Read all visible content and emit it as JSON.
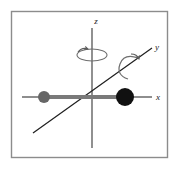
{
  "figure": {
    "frame": {
      "border_color": "#8c8c8c",
      "background_color": "#ffffff",
      "x": 11,
      "y": 11,
      "width": 157,
      "height": 147
    },
    "axes": [
      {
        "id": "z",
        "label": "z",
        "label_x": 96,
        "label_y": 24,
        "color": "#4d4d4d",
        "x1": 92,
        "y1": 28,
        "x2": 92,
        "y2": 148
      },
      {
        "id": "y",
        "label": "y",
        "label_x": 157,
        "label_y": 50,
        "color": "#1a1a1a",
        "x1": 33,
        "y1": 133,
        "x2": 152,
        "y2": 48
      },
      {
        "id": "x",
        "label": "x",
        "label_x": 158,
        "label_y": 100,
        "color": "#1a1a1a",
        "x1": 22,
        "y1": 97,
        "x2": 152,
        "y2": 97
      }
    ],
    "molecule": {
      "bond": {
        "color": "#7a7a7a",
        "x1": 44,
        "y1": 97,
        "x2": 125,
        "y2": 97,
        "thickness": 4
      },
      "atoms": [
        {
          "id": "atom-small",
          "color": "#666666",
          "cx": 44,
          "cy": 97,
          "r": 6
        },
        {
          "id": "atom-large",
          "color": "#111111",
          "cx": 125,
          "cy": 97,
          "r": 9
        }
      ]
    },
    "rotation_indicators": [
      {
        "id": "rotation-about-z",
        "about_axis": "z",
        "color": "#6e6e6e",
        "cx": 92,
        "cy": 55,
        "rx": 15,
        "ry": 6
      },
      {
        "id": "rotation-about-y",
        "about_axis": "y",
        "color": "#6e6e6e",
        "cx": 131,
        "cy": 66,
        "rx": 11,
        "ry": 13
      }
    ]
  }
}
